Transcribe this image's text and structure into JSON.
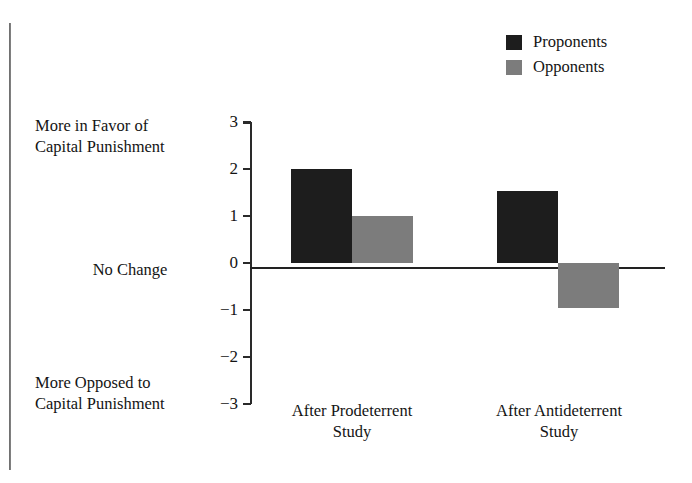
{
  "chart_data": {
    "type": "bar",
    "title": "",
    "subtitle": "",
    "xlabel": "",
    "ylabel": "",
    "categories": [
      "After Prodeterrent Study",
      "After Antideterrent Study"
    ],
    "category_lines": [
      [
        "After Prodeterrent",
        "Study"
      ],
      [
        "After Antideterrent",
        "Study"
      ]
    ],
    "series": [
      {
        "name": "Proponents",
        "color": "#1d1d1d",
        "values": [
          2.0,
          1.53
        ]
      },
      {
        "name": "Opponents",
        "color": "#7c7c7c",
        "values": [
          1.0,
          -0.95
        ]
      }
    ],
    "ylim": [
      -3,
      3
    ],
    "yticks": [
      3,
      2,
      1,
      0,
      -1,
      -2,
      -3
    ],
    "ytick_labels": [
      "3",
      "2",
      "1",
      "0",
      "−1",
      "−2",
      "−3"
    ],
    "grid": false,
    "legend_position": "top-right",
    "zero_line": true,
    "axis_annotations": {
      "top": [
        "More in Favor of",
        "Capital Punishment"
      ],
      "middle": [
        "No Change"
      ],
      "bottom": [
        "More Opposed to",
        "Capital Punishment"
      ]
    }
  },
  "legend": {
    "items": [
      {
        "label": "Proponents",
        "swatch": "#1d1d1d"
      },
      {
        "label": "Opponents",
        "swatch": "#7c7c7c"
      }
    ]
  },
  "axis": {
    "tick_labels": [
      "3",
      "2",
      "1",
      "0",
      "−1",
      "−2",
      "−3"
    ],
    "top_annotation_line1": "More in Favor of",
    "top_annotation_line2": "Capital Punishment",
    "middle_annotation": "No Change",
    "bottom_annotation_line1": "More Opposed to",
    "bottom_annotation_line2": "Capital Punishment"
  },
  "categories": {
    "group0_line1": "After Prodeterrent",
    "group0_line2": "Study",
    "group1_line1": "After Antideterrent",
    "group1_line2": "Study"
  }
}
